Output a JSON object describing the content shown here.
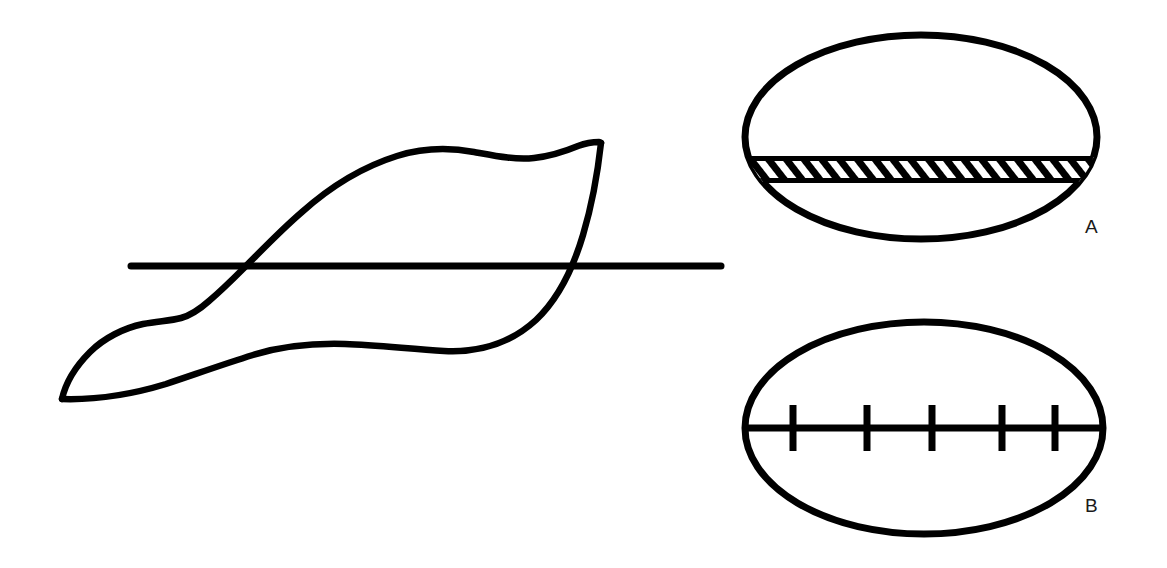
{
  "figure": {
    "background_color": "#ffffff",
    "ink_color": "#000000",
    "width": 1167,
    "height": 568,
    "panels": [
      {
        "id": "leaf-panel",
        "name": "leaf-outline-with-section-line",
        "description": "Hand-drawn leaf outline crossed by a straight horizontal section line",
        "elements": [
          {
            "name": "leaf-outline",
            "kind": "closed-curve",
            "stroke_width": 6
          },
          {
            "name": "section-line",
            "kind": "straight-line",
            "stroke_width": 7,
            "x1": 131,
            "y1": 266,
            "x2": 721,
            "y2": 266
          }
        ]
      },
      {
        "id": "panel-a",
        "label": "A",
        "name": "ellipse-with-hatched-band",
        "description": "Ellipse bisected by a horizontal band filled with diagonal hatching",
        "ellipse": {
          "cx": 921,
          "cy": 137,
          "rx": 176,
          "ry": 102,
          "stroke_width": 7
        },
        "band": {
          "top": 157,
          "bottom": 182,
          "hatch": "diagonal",
          "hatch_count": 24
        }
      },
      {
        "id": "panel-b",
        "label": "B",
        "name": "ellipse-with-tick-marked-line",
        "description": "Ellipse bisected by a horizontal line bearing five short vertical tick marks",
        "ellipse": {
          "cx": 924,
          "cy": 428,
          "rx": 179,
          "ry": 106,
          "stroke_width": 7
        },
        "center_line": {
          "y": 428,
          "stroke_width": 7
        },
        "ticks": [
          793,
          867,
          932,
          1002,
          1055
        ],
        "tick_count": 5,
        "tick_height": 46
      }
    ],
    "labels": {
      "panel_a": "A",
      "panel_b": "B"
    },
    "label_positions": {
      "panel_a": {
        "x": 1085,
        "y": 233
      },
      "panel_b": {
        "x": 1085,
        "y": 512
      }
    }
  }
}
